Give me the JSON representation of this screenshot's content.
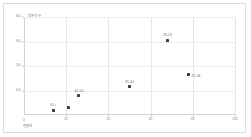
{
  "chart_data": {
    "type": "scatter",
    "title": "",
    "xlabel": "연령대",
    "ylabel": "방문객 수",
    "xlim": [
      0,
      100
    ],
    "ylim": [
      0,
      400
    ],
    "grid": true,
    "legend": "none",
    "origin_label": "0",
    "xticks": [
      "0",
      "20",
      "40",
      "60",
      "80",
      "100"
    ],
    "xtick_values": [
      0,
      20,
      40,
      60,
      80,
      100
    ],
    "yticks": [
      "0",
      "100",
      "200",
      "300",
      "400"
    ],
    "ytick_values": [
      0,
      100,
      200,
      300,
      400
    ],
    "points": [
      {
        "label": "65+",
        "x": 14,
        "y": 18,
        "label_pos": "top"
      },
      {
        "label": "",
        "x": 21,
        "y": 32,
        "label_pos": "none"
      },
      {
        "label": "45-54",
        "x": 26,
        "y": 78,
        "label_pos": "top"
      },
      {
        "label": "35-44",
        "x": 50,
        "y": 115,
        "label_pos": "top"
      },
      {
        "label": "18-24",
        "x": 68,
        "y": 305,
        "label_pos": "top"
      },
      {
        "label": "25-34",
        "x": 78,
        "y": 165,
        "label_pos": "right"
      }
    ]
  }
}
